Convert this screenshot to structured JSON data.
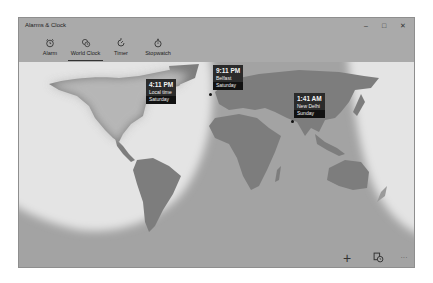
{
  "window": {
    "title": "Alarms & Clock",
    "controls": {
      "minimize": "–",
      "maximize": "□",
      "close": "✕"
    }
  },
  "tabs": [
    {
      "label": "Alarm",
      "icon": "alarm-clock-icon",
      "active": false
    },
    {
      "label": "World Clock",
      "icon": "world-clock-icon",
      "active": true
    },
    {
      "label": "Timer",
      "icon": "timer-icon",
      "active": false
    },
    {
      "label": "Stopwatch",
      "icon": "stopwatch-icon",
      "active": false
    }
  ],
  "clocks": [
    {
      "time": "4:11 PM",
      "place": "Local time",
      "day": "Saturday"
    },
    {
      "time": "9:11 PM",
      "place": "Belfast",
      "day": "Saturday"
    },
    {
      "time": "1:41 AM",
      "place": "New Delhi",
      "day": "Sunday"
    }
  ],
  "commands": {
    "add": "+",
    "compare": "compare-icon",
    "more": "···"
  },
  "colors": {
    "night": "#a3a3a3",
    "day": "#e4e4e4",
    "land_night": "#7d7d7d",
    "land_day": "#bdbdbd",
    "card_bg": "#2b2b2b"
  }
}
